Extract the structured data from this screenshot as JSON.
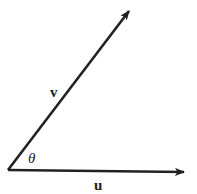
{
  "diagram": {
    "type": "vector-angle",
    "vectors": [
      {
        "name": "u",
        "label": "u",
        "from": [
          8,
          170
        ],
        "to": [
          184,
          172
        ],
        "style": "bold"
      },
      {
        "name": "v",
        "label": "v",
        "from": [
          8,
          170
        ],
        "to": [
          130,
          10
        ],
        "style": "bold"
      }
    ],
    "angle": {
      "label": "θ",
      "between": [
        "u",
        "v"
      ]
    },
    "colors": {
      "stroke": "#222222",
      "background": "#ffffff"
    }
  }
}
